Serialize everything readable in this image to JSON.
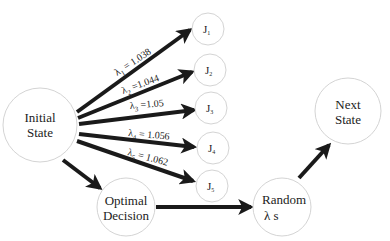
{
  "nodes": {
    "initial": {
      "lines": [
        "Initial",
        "State"
      ]
    },
    "optimal": {
      "lines": [
        "Optimal",
        "Decision"
      ]
    },
    "random": {
      "lines": [
        "Random",
        "λ s"
      ]
    },
    "next": {
      "lines": [
        "Next",
        "State"
      ]
    },
    "jobs": [
      {
        "main": "J",
        "sub": "1"
      },
      {
        "main": "J",
        "sub": "2"
      },
      {
        "main": "J",
        "sub": "3"
      },
      {
        "main": "J",
        "sub": "4"
      },
      {
        "main": "J",
        "sub": "5"
      }
    ]
  },
  "edge_labels": [
    {
      "symbol": "λ",
      "sub": "1",
      "text": " = 1.038"
    },
    {
      "symbol": "λ",
      "sub": "2",
      "text": " =1.044"
    },
    {
      "symbol": "λ",
      "sub": "3",
      "text": " =1.05"
    },
    {
      "symbol": "λ",
      "sub": "4",
      "text": " = 1.056"
    },
    {
      "symbol": "λ",
      "sub": "5",
      "text": " = 1.062"
    }
  ],
  "colors": {
    "edge": "#1a1a1a",
    "node_stroke": "#d4d4d4",
    "text": "#222222"
  }
}
